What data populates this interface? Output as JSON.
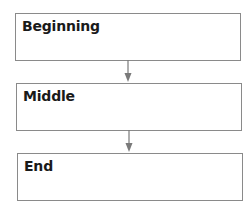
{
  "diagram": {
    "type": "flowchart",
    "direction": "top-to-bottom",
    "colors": {
      "border": "#8a8a8a",
      "arrow": "#7a7a7a",
      "text": "#1a1a1a",
      "background": "#ffffff"
    },
    "nodes": [
      {
        "id": "n1",
        "label": "Beginning"
      },
      {
        "id": "n2",
        "label": "Middle"
      },
      {
        "id": "n3",
        "label": "End"
      }
    ],
    "edges": [
      {
        "from": "n1",
        "to": "n2"
      },
      {
        "from": "n2",
        "to": "n3"
      }
    ]
  }
}
